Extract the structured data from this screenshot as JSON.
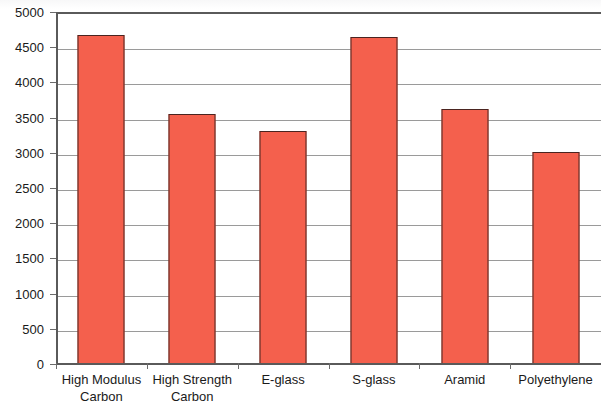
{
  "chart_data": {
    "type": "bar",
    "title": "",
    "subtitle": "",
    "xlabel": "",
    "ylabel": "",
    "categories": [
      "High Modulus\nCarbon",
      "High Strength\nCarbon",
      "E-glass",
      "S-glass",
      "Aramid",
      "Polyethylene"
    ],
    "values": [
      4680,
      3545,
      3305,
      4640,
      3625,
      3015
    ],
    "series": [
      {
        "name": "Tensile Strength",
        "values": [
          4680,
          3545,
          3305,
          4640,
          3625,
          3015
        ]
      }
    ],
    "ylim": [
      0,
      5000
    ],
    "yticks": [
      0,
      500,
      1000,
      1500,
      2000,
      2500,
      3000,
      3500,
      4000,
      4500,
      5000
    ],
    "ytick_labels": [
      "0",
      "500",
      "1000",
      "1500",
      "2000",
      "2500",
      "3000",
      "3500",
      "4000",
      "4500",
      "5000"
    ],
    "grid": true,
    "grid_axis": "y",
    "legend": false,
    "legend_position": "none",
    "bar_color": "#F4604D",
    "bar_border_color": "#4A2420",
    "gridline_color": "#9A9A9A",
    "axis_color": "#5A5A5A",
    "text_color": "#1A1A1A"
  }
}
